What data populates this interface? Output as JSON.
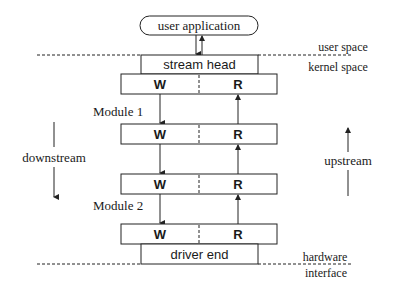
{
  "diagram": {
    "colors": {
      "stroke": "#222222",
      "text": "#1a1a1a",
      "background": "#ffffff"
    },
    "top_node": {
      "label": "user application"
    },
    "stream_head": {
      "label": "stream head"
    },
    "queue_pairs": [
      {
        "write_label": "W",
        "read_label": "R"
      },
      {
        "write_label": "W",
        "read_label": "R"
      },
      {
        "write_label": "W",
        "read_label": "R"
      },
      {
        "write_label": "W",
        "read_label": "R"
      }
    ],
    "modules": [
      {
        "label": "Module 1"
      },
      {
        "label": "Module 2"
      }
    ],
    "driver_end": {
      "label": "driver end"
    },
    "boundaries": {
      "user_space": "user space",
      "kernel_space": "kernel space",
      "hardware": "hardware",
      "interface": "interface"
    },
    "directions": {
      "downstream": "downstream",
      "upstream": "upstream"
    }
  }
}
